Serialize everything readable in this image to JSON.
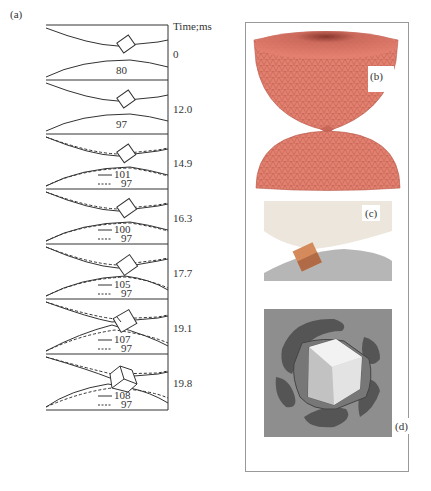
{
  "figure": {
    "panel_a": {
      "label": "(a)",
      "axis_title": "Time;ms",
      "frames": [
        {
          "time": "0",
          "solid": "80",
          "dashed": null
        },
        {
          "time": "12.0",
          "solid": "97",
          "dashed": null
        },
        {
          "time": "14.9",
          "solid": "101",
          "dashed": "97"
        },
        {
          "time": "16.3",
          "solid": "100",
          "dashed": "97"
        },
        {
          "time": "17.7",
          "solid": "105",
          "dashed": "97"
        },
        {
          "time": "19.1",
          "solid": "107",
          "dashed": "97"
        },
        {
          "time": "19.8",
          "solid": "108",
          "dashed": "97"
        }
      ]
    },
    "panel_b": {
      "label": "(b)"
    },
    "panel_c": {
      "label": "(c)"
    },
    "panel_d": {
      "label": "(d)"
    },
    "colors": {
      "line": "#333333",
      "sphere": "#e4806f",
      "sphere_dark": "#c25b4c",
      "panel_c_top": "#ece7dc",
      "panel_c_bottom": "#b9b9b9",
      "cube": "#d98a5d",
      "panel_d_bg": "#8e8e8e",
      "panel_d_blob": "#555555",
      "panel_d_cube": "#e8e8e8"
    }
  }
}
